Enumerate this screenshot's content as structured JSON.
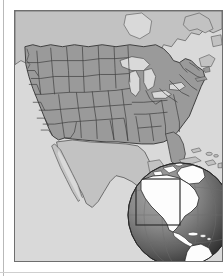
{
  "document": {
    "type": "map-figure",
    "subject": "Contiguous United States with state boundaries",
    "style": "grayscale reference map"
  },
  "colors": {
    "page_background": "#ffffff",
    "ocean": "#d9d9d9",
    "united_states_fill": "#9a9a9a",
    "neighbor_fill": "#c2c2c2",
    "border_line": "#4a4a4a",
    "frame_line": "#6e6e6e",
    "globe_ocean_light": "#8e8e8e",
    "globe_ocean_dark": "#3a3a3a",
    "globe_land": "#fdfdfd",
    "globe_outline": "#2a2a2a",
    "highlight_box": "#3a3a3a"
  },
  "map": {
    "frame": {
      "x": 14,
      "y": 10,
      "width": 209,
      "height": 252,
      "border_width": 1
    },
    "projection_note": "conic, North America",
    "regions": [
      {
        "name": "united-states",
        "fill_role": "united_states_fill"
      },
      {
        "name": "canada",
        "fill_role": "neighbor_fill"
      },
      {
        "name": "mexico",
        "fill_role": "neighbor_fill"
      },
      {
        "name": "atlantic-ocean",
        "fill_role": "ocean"
      },
      {
        "name": "pacific-ocean",
        "fill_role": "ocean"
      },
      {
        "name": "gulf-of-mexico",
        "fill_role": "ocean"
      },
      {
        "name": "great-lakes",
        "fill_role": "ocean"
      }
    ],
    "features_shown": [
      "state-boundaries",
      "national-boundaries",
      "coastline",
      "great-lakes",
      "baja-california-peninsula",
      "florida-peninsula",
      "caribbean-islands",
      "long-island",
      "cape-cod",
      "puget-sound"
    ]
  },
  "globe_inset": {
    "x": 104,
    "y": 143,
    "width": 122,
    "height": 122,
    "radius": 52,
    "shading": "sphere, lit from upper-left",
    "landmasses": [
      "north-america",
      "south-america",
      "central-america",
      "greenland",
      "caribbean-islands",
      "western-europe-edge",
      "northwest-africa-edge"
    ],
    "highlight_rectangle": {
      "label": "detail-area-indicator",
      "x": 121,
      "y": 168,
      "width": 44,
      "height": 46
    },
    "graticule": {
      "visible": true,
      "meridians": 3,
      "parallels": 2
    }
  }
}
